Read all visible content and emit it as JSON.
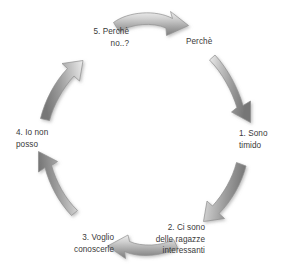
{
  "diagram": {
    "type": "cycle",
    "title": "",
    "language": "it",
    "shape": "circular-loop",
    "direction": "clockwise",
    "background_color": "#ffffff",
    "text_color": "#3a3a3a",
    "arrow_fill_light": "#e8e8e8",
    "arrow_fill_mid": "#b0b0b0",
    "arrow_fill_dark": "#6f6f6f",
    "arrow_stroke": "#8a8a8a",
    "nodes": [
      {
        "id": "start",
        "label": "Perchè"
      },
      {
        "id": "step1",
        "label": "1. Sono\ntimido"
      },
      {
        "id": "step2",
        "label": "2. Ci sono\ndelle ragazze\ninteressanti"
      },
      {
        "id": "step3",
        "label": "3. Voglio\nconoscerle"
      },
      {
        "id": "step4",
        "label": "4. Io non\nposso"
      },
      {
        "id": "step5",
        "label": "5. Perchè\nno..?"
      }
    ],
    "arrows": [
      {
        "id": "arrow-top",
        "from": "step5",
        "to": "start",
        "points": "right"
      },
      {
        "id": "arrow-upper-right",
        "from": "start",
        "to": "step1",
        "points": "down"
      },
      {
        "id": "arrow-lower-right",
        "from": "step1",
        "to": "step2",
        "points": "down-left"
      },
      {
        "id": "arrow-bottom",
        "from": "step2",
        "to": "step3",
        "points": "left"
      },
      {
        "id": "arrow-lower-left",
        "from": "step3",
        "to": "step4",
        "points": "up-left"
      },
      {
        "id": "arrow-upper-left",
        "from": "step4",
        "to": "step5",
        "points": "up-right"
      }
    ]
  }
}
